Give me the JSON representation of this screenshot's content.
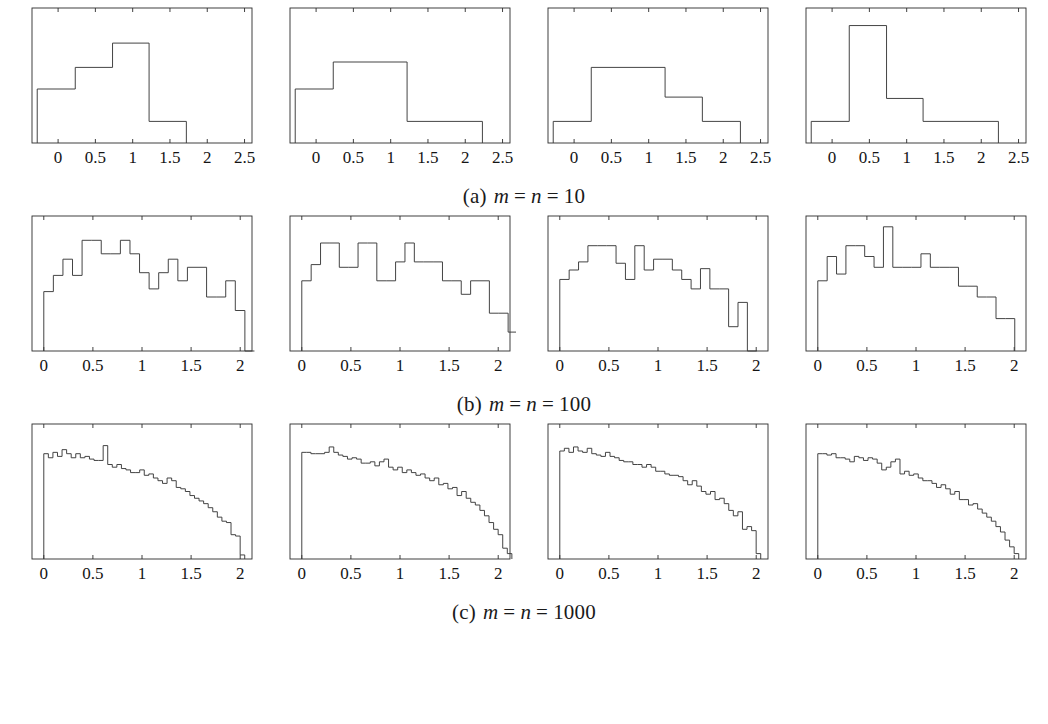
{
  "figure": {
    "type": "multi-panel-histogram-figure",
    "rows": 3,
    "columns": 4,
    "background_color": "#ffffff",
    "line_color": "#3a3a3a",
    "axis_color": "#2b2b2b"
  },
  "captions": [
    {
      "label": "(a)",
      "var1": "m",
      "eq1": "=",
      "var2": "n",
      "eq2": "=",
      "value": "10"
    },
    {
      "label": "(b)",
      "var1": "m",
      "eq1": "=",
      "var2": "n",
      "eq2": "=",
      "value": "100"
    },
    {
      "label": "(c)",
      "var1": "m",
      "eq1": "=",
      "var2": "n",
      "eq2": "=",
      "value": "1000"
    }
  ],
  "chart_data": [
    {
      "id": "a1",
      "type": "bar",
      "title": "",
      "xlabel": "",
      "ylabel": "",
      "grid": false,
      "legend": "none",
      "xlim": [
        -0.35,
        2.6
      ],
      "ylim": [
        0,
        1.0
      ],
      "xticks": [
        0,
        0.5,
        1,
        1.5,
        2,
        2.5
      ],
      "xticklabels": [
        "0",
        "0.5",
        "1",
        "1.5",
        "2",
        "2.5"
      ],
      "bin_edges": [
        -0.28,
        0.23,
        0.73,
        1.22,
        1.72
      ],
      "values": [
        0.4,
        0.56,
        0.74,
        0.16
      ]
    },
    {
      "id": "a2",
      "type": "bar",
      "title": "",
      "xlabel": "",
      "ylabel": "",
      "grid": false,
      "legend": "none",
      "xlim": [
        -0.35,
        2.6
      ],
      "ylim": [
        0,
        1.0
      ],
      "xticks": [
        0,
        0.5,
        1,
        1.5,
        2,
        2.5
      ],
      "xticklabels": [
        "0",
        "0.5",
        "1",
        "1.5",
        "2",
        "2.5"
      ],
      "bin_edges": [
        -0.28,
        0.23,
        1.22,
        2.23
      ],
      "values": [
        0.4,
        0.6,
        0.16
      ]
    },
    {
      "id": "a3",
      "type": "bar",
      "title": "",
      "xlabel": "",
      "ylabel": "",
      "grid": false,
      "legend": "none",
      "xlim": [
        -0.35,
        2.6
      ],
      "ylim": [
        0,
        1.0
      ],
      "xticks": [
        0,
        0.5,
        1,
        1.5,
        2,
        2.5
      ],
      "xticklabels": [
        "0",
        "0.5",
        "1",
        "1.5",
        "2",
        "2.5"
      ],
      "bin_edges": [
        -0.28,
        0.23,
        1.22,
        1.72,
        2.23
      ],
      "values": [
        0.16,
        0.56,
        0.34,
        0.16
      ]
    },
    {
      "id": "a4",
      "type": "bar",
      "title": "",
      "xlabel": "",
      "ylabel": "",
      "grid": false,
      "legend": "none",
      "xlim": [
        -0.35,
        2.6
      ],
      "ylim": [
        0,
        1.0
      ],
      "xticks": [
        0,
        0.5,
        1,
        1.5,
        2,
        2.5
      ],
      "xticklabels": [
        "0",
        "0.5",
        "1",
        "1.5",
        "2",
        "2.5"
      ],
      "bin_edges": [
        -0.28,
        0.23,
        0.73,
        1.22,
        2.23
      ],
      "values": [
        0.16,
        0.87,
        0.33,
        0.16
      ]
    },
    {
      "id": "b1",
      "type": "bar",
      "title": "",
      "xlabel": "",
      "ylabel": "",
      "grid": false,
      "legend": "none",
      "xlim": [
        -0.12,
        2.12
      ],
      "ylim": [
        0,
        1.0
      ],
      "xticks": [
        0,
        0.5,
        1,
        1.5,
        2
      ],
      "xticklabels": [
        "0",
        "0.5",
        "1",
        "1.5",
        "2"
      ],
      "bin_start": 0.0,
      "bin_width": 0.0975,
      "values": [
        0.44,
        0.56,
        0.68,
        0.56,
        0.82,
        0.82,
        0.72,
        0.72,
        0.82,
        0.72,
        0.58,
        0.46,
        0.58,
        0.68,
        0.52,
        0.62,
        0.62,
        0.4,
        0.4,
        0.52,
        0.3,
        0.0
      ]
    },
    {
      "id": "b2",
      "type": "bar",
      "title": "",
      "xlabel": "",
      "ylabel": "",
      "grid": false,
      "legend": "none",
      "xlim": [
        -0.12,
        2.12
      ],
      "ylim": [
        0,
        1.0
      ],
      "xticks": [
        0,
        0.5,
        1,
        1.5,
        2
      ],
      "xticklabels": [
        "0",
        "0.5",
        "1",
        "1.5",
        "2"
      ],
      "bin_start": 0.0,
      "bin_width": 0.0955,
      "values": [
        0.52,
        0.64,
        0.8,
        0.8,
        0.62,
        0.62,
        0.8,
        0.8,
        0.52,
        0.52,
        0.66,
        0.8,
        0.66,
        0.66,
        0.66,
        0.52,
        0.52,
        0.42,
        0.52,
        0.52,
        0.28,
        0.28,
        0.14
      ]
    },
    {
      "id": "b3",
      "type": "bar",
      "title": "",
      "xlabel": "",
      "ylabel": "",
      "grid": false,
      "legend": "none",
      "xlim": [
        -0.12,
        2.12
      ],
      "ylim": [
        0,
        1.0
      ],
      "xticks": [
        0,
        0.5,
        1,
        1.5,
        2
      ],
      "xticklabels": [
        "0",
        "0.5",
        "1",
        "1.5",
        "2"
      ],
      "bin_start": 0.0,
      "bin_width": 0.0955,
      "values": [
        0.53,
        0.6,
        0.66,
        0.78,
        0.78,
        0.78,
        0.65,
        0.53,
        0.78,
        0.6,
        0.68,
        0.68,
        0.6,
        0.53,
        0.46,
        0.61,
        0.46,
        0.46,
        0.18,
        0.36,
        0.0
      ]
    },
    {
      "id": "b4",
      "type": "bar",
      "title": "",
      "xlabel": "",
      "ylabel": "",
      "grid": false,
      "legend": "none",
      "xlim": [
        -0.12,
        2.12
      ],
      "ylim": [
        0,
        1.0
      ],
      "xticks": [
        0,
        0.5,
        1,
        1.5,
        2
      ],
      "xticklabels": [
        "0",
        "0.5",
        "1",
        "1.5",
        "2"
      ],
      "bin_start": 0.0,
      "bin_width": 0.0955,
      "values": [
        0.52,
        0.7,
        0.57,
        0.78,
        0.78,
        0.7,
        0.62,
        0.92,
        0.62,
        0.62,
        0.62,
        0.72,
        0.62,
        0.62,
        0.62,
        0.48,
        0.48,
        0.4,
        0.4,
        0.24,
        0.24
      ]
    },
    {
      "id": "c1",
      "type": "bar",
      "title": "",
      "xlabel": "",
      "ylabel": "",
      "grid": false,
      "legend": "none",
      "xlim": [
        -0.12,
        2.12
      ],
      "ylim": [
        0,
        1.0
      ],
      "xticks": [
        0,
        0.5,
        1,
        1.5,
        2
      ],
      "xticklabels": [
        "0",
        "0.5",
        "1",
        "1.5",
        "2"
      ],
      "bin_start": 0.0,
      "bin_width": 0.0465,
      "values": [
        0.78,
        0.75,
        0.79,
        0.76,
        0.81,
        0.78,
        0.75,
        0.78,
        0.75,
        0.76,
        0.74,
        0.73,
        0.73,
        0.84,
        0.7,
        0.68,
        0.7,
        0.67,
        0.66,
        0.64,
        0.64,
        0.66,
        0.62,
        0.63,
        0.6,
        0.58,
        0.56,
        0.6,
        0.58,
        0.53,
        0.52,
        0.5,
        0.47,
        0.45,
        0.43,
        0.41,
        0.38,
        0.35,
        0.31,
        0.28,
        0.27,
        0.18,
        0.17,
        0.03
      ]
    },
    {
      "id": "c2",
      "type": "bar",
      "title": "",
      "xlabel": "",
      "ylabel": "",
      "grid": false,
      "legend": "none",
      "xlim": [
        -0.12,
        2.12
      ],
      "ylim": [
        0,
        1.0
      ],
      "xticks": [
        0,
        0.5,
        1,
        1.5,
        2
      ],
      "xticklabels": [
        "0",
        "0.5",
        "1",
        "1.5",
        "2"
      ],
      "bin_start": 0.0,
      "bin_width": 0.0465,
      "values": [
        0.79,
        0.79,
        0.78,
        0.78,
        0.78,
        0.79,
        0.83,
        0.79,
        0.77,
        0.76,
        0.74,
        0.75,
        0.74,
        0.71,
        0.71,
        0.72,
        0.69,
        0.72,
        0.74,
        0.68,
        0.66,
        0.68,
        0.64,
        0.66,
        0.64,
        0.62,
        0.63,
        0.6,
        0.58,
        0.6,
        0.55,
        0.56,
        0.52,
        0.53,
        0.47,
        0.5,
        0.45,
        0.42,
        0.4,
        0.36,
        0.32,
        0.27,
        0.22,
        0.18,
        0.08,
        0.04
      ]
    },
    {
      "id": "c3",
      "type": "bar",
      "title": "",
      "xlabel": "",
      "ylabel": "",
      "grid": false,
      "legend": "none",
      "xlim": [
        -0.12,
        2.12
      ],
      "ylim": [
        0,
        1.0
      ],
      "xticks": [
        0,
        0.5,
        1,
        1.5,
        2
      ],
      "xticklabels": [
        "0",
        "0.5",
        "1",
        "1.5",
        "2"
      ],
      "bin_start": 0.0,
      "bin_width": 0.0465,
      "values": [
        0.8,
        0.82,
        0.79,
        0.83,
        0.8,
        0.79,
        0.82,
        0.78,
        0.77,
        0.76,
        0.79,
        0.76,
        0.75,
        0.73,
        0.72,
        0.72,
        0.7,
        0.7,
        0.68,
        0.7,
        0.68,
        0.65,
        0.65,
        0.63,
        0.62,
        0.62,
        0.61,
        0.58,
        0.55,
        0.58,
        0.54,
        0.5,
        0.48,
        0.5,
        0.44,
        0.45,
        0.41,
        0.36,
        0.32,
        0.35,
        0.22,
        0.24,
        0.21,
        0.04
      ]
    },
    {
      "id": "c4",
      "type": "bar",
      "title": "",
      "xlabel": "",
      "ylabel": "",
      "grid": false,
      "legend": "none",
      "xlim": [
        -0.12,
        2.12
      ],
      "ylim": [
        0,
        1.0
      ],
      "xticks": [
        0,
        0.5,
        1,
        1.5,
        2
      ],
      "xticklabels": [
        "0",
        "0.5",
        "1",
        "1.5",
        "2"
      ],
      "bin_start": 0.0,
      "bin_width": 0.0465,
      "values": [
        0.78,
        0.78,
        0.77,
        0.78,
        0.75,
        0.75,
        0.74,
        0.72,
        0.76,
        0.75,
        0.73,
        0.75,
        0.74,
        0.71,
        0.66,
        0.68,
        0.72,
        0.74,
        0.63,
        0.65,
        0.62,
        0.63,
        0.6,
        0.58,
        0.58,
        0.56,
        0.53,
        0.55,
        0.52,
        0.48,
        0.5,
        0.44,
        0.44,
        0.4,
        0.41,
        0.37,
        0.34,
        0.31,
        0.28,
        0.24,
        0.2,
        0.14,
        0.09,
        0.04
      ]
    }
  ],
  "panel_layout": {
    "row_a_ids": [
      "a1",
      "a2",
      "a3",
      "a4"
    ],
    "row_b_ids": [
      "b1",
      "b2",
      "b3",
      "b4"
    ],
    "row_c_ids": [
      "c1",
      "c2",
      "c3",
      "c4"
    ],
    "panel_x_offsets": [
      10,
      268,
      526,
      784
    ]
  }
}
